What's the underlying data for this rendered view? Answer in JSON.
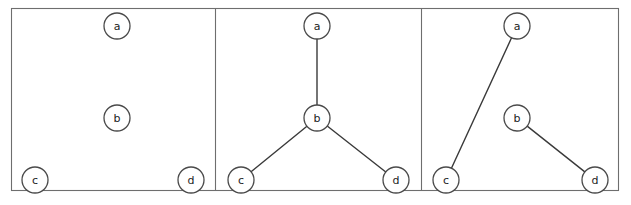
{
  "figure": {
    "width": 631,
    "height": 205,
    "background_color": "#ffffff",
    "frame": {
      "x": 11,
      "y": 8,
      "width": 607,
      "height": 182,
      "border_color": "#6e6e6e",
      "border_width": 1.1
    },
    "dividers": [
      215,
      421
    ],
    "node_radius": 13,
    "node_fill": "#ffffff",
    "node_stroke": "#4a4a4a",
    "edge_color": "#3a3a3a",
    "label_color": "#1c1c1c"
  },
  "chart_data": {
    "type": "diagram",
    "title": "",
    "subtitle": "",
    "panels": [
      {
        "index": 1,
        "name": "panel-empty-graph",
        "caption": "",
        "nodes": [
          {
            "id": "a",
            "label": "a",
            "cx": 117,
            "cy": 26
          },
          {
            "id": "b",
            "label": "b",
            "cx": 117,
            "cy": 118
          },
          {
            "id": "c",
            "label": "c",
            "cx": 35,
            "cy": 180
          },
          {
            "id": "d",
            "label": "d",
            "cx": 191,
            "cy": 180
          }
        ],
        "edges": []
      },
      {
        "index": 2,
        "name": "panel-star-graph",
        "caption": "",
        "nodes": [
          {
            "id": "a",
            "label": "a",
            "cx": 317,
            "cy": 26
          },
          {
            "id": "b",
            "label": "b",
            "cx": 317,
            "cy": 118
          },
          {
            "id": "c",
            "label": "c",
            "cx": 241,
            "cy": 180
          },
          {
            "id": "d",
            "label": "d",
            "cx": 396,
            "cy": 180
          }
        ],
        "edges": [
          {
            "from": "a",
            "to": "b"
          },
          {
            "from": "b",
            "to": "c"
          },
          {
            "from": "b",
            "to": "d"
          }
        ]
      },
      {
        "index": 3,
        "name": "panel-matching-graph",
        "caption": "",
        "nodes": [
          {
            "id": "a",
            "label": "a",
            "cx": 517,
            "cy": 26
          },
          {
            "id": "b",
            "label": "b",
            "cx": 517,
            "cy": 118
          },
          {
            "id": "c",
            "label": "c",
            "cx": 446,
            "cy": 180
          },
          {
            "id": "d",
            "label": "d",
            "cx": 595,
            "cy": 180
          }
        ],
        "edges": [
          {
            "from": "a",
            "to": "c"
          },
          {
            "from": "b",
            "to": "d"
          }
        ]
      }
    ]
  }
}
